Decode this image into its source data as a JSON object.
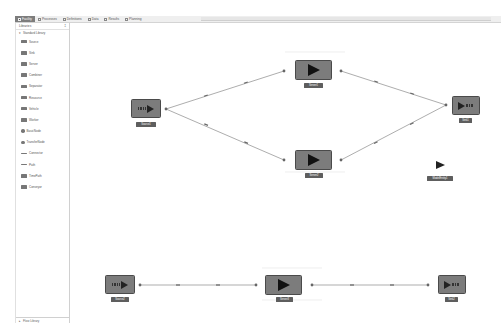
{
  "tabs": [
    {
      "label": "Facility",
      "icon": "facility-icon",
      "active": true
    },
    {
      "label": "Processes",
      "icon": "processes-icon",
      "active": false
    },
    {
      "label": "Definitions",
      "icon": "definitions-icon",
      "active": false
    },
    {
      "label": "Data",
      "icon": "data-icon",
      "active": false
    },
    {
      "label": "Results",
      "icon": "results-icon",
      "active": false
    },
    {
      "label": "Planning",
      "icon": "planning-icon",
      "active": false
    }
  ],
  "sidebar": {
    "title": "Libraries",
    "pin_glyph": "‡",
    "group": "Standard Library",
    "items": [
      {
        "label": "Source",
        "icon": "source-icon"
      },
      {
        "label": "Sink",
        "icon": "sink-icon"
      },
      {
        "label": "Server",
        "icon": "server-icon"
      },
      {
        "label": "Combiner",
        "icon": "combiner-icon"
      },
      {
        "label": "Separator",
        "icon": "separator-icon"
      },
      {
        "label": "Resource",
        "icon": "resource-icon"
      },
      {
        "label": "Vehicle",
        "icon": "vehicle-icon"
      },
      {
        "label": "Worker",
        "icon": "worker-icon"
      },
      {
        "label": "BasicNode",
        "icon": "basic-node-icon"
      },
      {
        "label": "TransferNode",
        "icon": "transfer-node-icon"
      },
      {
        "label": "Connector",
        "icon": "connector-icon"
      },
      {
        "label": "Path",
        "icon": "path-icon"
      },
      {
        "label": "TimePath",
        "icon": "time-path-icon"
      },
      {
        "label": "Conveyor",
        "icon": "conveyor-icon"
      }
    ],
    "footer": "Flow Library"
  },
  "canvas": {
    "nodes": [
      {
        "id": "source1",
        "type": "source",
        "label": "Source1"
      },
      {
        "id": "server1",
        "type": "server",
        "label": "Server1"
      },
      {
        "id": "server2",
        "type": "server",
        "label": "Server2"
      },
      {
        "id": "sink1",
        "type": "sink",
        "label": "Sink1"
      },
      {
        "id": "source2",
        "type": "source",
        "label": "Source2"
      },
      {
        "id": "server3",
        "type": "server",
        "label": "Server3"
      },
      {
        "id": "sink2",
        "type": "sink",
        "label": "Sink2"
      }
    ],
    "entity": {
      "label": "ModelEntity1"
    },
    "links": [
      {
        "from": "Source1",
        "to": "Server1"
      },
      {
        "from": "Source1",
        "to": "Server2"
      },
      {
        "from": "Server1",
        "to": "Sink1"
      },
      {
        "from": "Server2",
        "to": "Sink1"
      },
      {
        "from": "Source2",
        "to": "Server3"
      },
      {
        "from": "Server3",
        "to": "Sink2"
      }
    ]
  }
}
